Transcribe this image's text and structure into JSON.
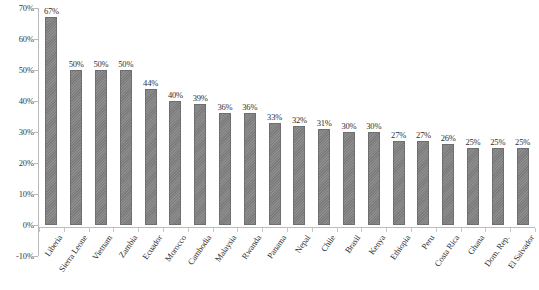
{
  "chart_data": {
    "type": "bar",
    "title": "",
    "subtitle": "",
    "xlabel": "",
    "ylabel": "",
    "ylim": [
      -10,
      70
    ],
    "ytick_step": 10,
    "grid": false,
    "legend": null,
    "bar_color": "#808080",
    "bar_edge_color": "#6e6e6e",
    "axis_color": "#b9b9b9",
    "background": "#ffffff",
    "value_label_suffix": "%",
    "ytick_labels": [
      "70%",
      "60%",
      "50%",
      "40%",
      "30%",
      "20%",
      "10%",
      "0%",
      "-10%"
    ],
    "ytick_values": [
      70,
      60,
      50,
      40,
      30,
      20,
      10,
      0,
      -10
    ],
    "categories": [
      "Liberia",
      "Sierra Leone",
      "Vietnam",
      "Zambia",
      "Ecuador",
      "Morocco",
      "Cambodia",
      "Malaysia",
      "Rwanda",
      "Panama",
      "Nepal",
      "Chile",
      "Brasil",
      "Kenya",
      "Ethiopia",
      "Peru",
      "Costa Rica",
      "Ghana",
      "Dom. Rep.",
      "El Salvador"
    ],
    "values": [
      67,
      50,
      50,
      50,
      44,
      40,
      39,
      36,
      36,
      33,
      32,
      31,
      30,
      30,
      27,
      27,
      26,
      25,
      25,
      25
    ],
    "value_labels": [
      "67%",
      "50%",
      "50%",
      "50%",
      "44%",
      "40%",
      "39%",
      "36%",
      "36%",
      "33%",
      "32%",
      "31%",
      "30%",
      "30%",
      "27%",
      "27%",
      "26%",
      "25%",
      "25%",
      "25%"
    ]
  }
}
